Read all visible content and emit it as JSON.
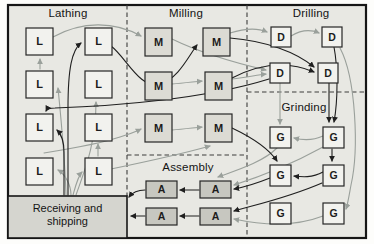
{
  "figure": {
    "title_hint": "process-layout-diagram",
    "background": "#e8e8e3",
    "border_color": "#161616",
    "divider_color": "#3c3c3c",
    "arrow_colors": {
      "primary": "#1f1f1f",
      "secondary": "#9aa09b"
    },
    "sections": [
      {
        "id": "lathing",
        "label": "Lathing",
        "cx": 68,
        "cy": 7
      },
      {
        "id": "milling",
        "label": "Milling",
        "cx": 186,
        "cy": 7
      },
      {
        "id": "drilling",
        "label": "Drilling",
        "cx": 311,
        "cy": 7
      },
      {
        "id": "grinding",
        "label": "Grinding",
        "cx": 304,
        "cy": 101
      },
      {
        "id": "assembly",
        "label": "Assembly",
        "cx": 188,
        "cy": 161
      }
    ],
    "receiving": {
      "label_line1": "Receiving and",
      "label_line2": "shipping",
      "x": 8,
      "y": 196,
      "w": 119,
      "h": 42,
      "fill": "#d5d5cf"
    },
    "dividers": [
      {
        "x1": 127,
        "y1": 5,
        "x2": 127,
        "y2": 196
      },
      {
        "x1": 247,
        "y1": 5,
        "x2": 247,
        "y2": 238
      },
      {
        "x1": 247,
        "y1": 92,
        "x2": 366,
        "y2": 92
      },
      {
        "x1": 127,
        "y1": 155,
        "x2": 247,
        "y2": 155
      }
    ],
    "nodes": [
      {
        "id": "L1",
        "letter": "L",
        "x": 26,
        "y": 28,
        "w": 27,
        "h": 27,
        "fill": "#f2f2ee"
      },
      {
        "id": "L2",
        "letter": "L",
        "x": 85,
        "y": 28,
        "w": 27,
        "h": 27,
        "fill": "#f2f2ee"
      },
      {
        "id": "L3",
        "letter": "L",
        "x": 26,
        "y": 71,
        "w": 27,
        "h": 27,
        "fill": "#f2f2ee"
      },
      {
        "id": "L4",
        "letter": "L",
        "x": 85,
        "y": 71,
        "w": 27,
        "h": 27,
        "fill": "#f2f2ee"
      },
      {
        "id": "L5",
        "letter": "L",
        "x": 26,
        "y": 114,
        "w": 27,
        "h": 27,
        "fill": "#f2f2ee"
      },
      {
        "id": "L6",
        "letter": "L",
        "x": 85,
        "y": 114,
        "w": 27,
        "h": 27,
        "fill": "#f2f2ee"
      },
      {
        "id": "L7",
        "letter": "L",
        "x": 26,
        "y": 158,
        "w": 27,
        "h": 27,
        "fill": "#f2f2ee"
      },
      {
        "id": "L8",
        "letter": "L",
        "x": 85,
        "y": 158,
        "w": 27,
        "h": 27,
        "fill": "#f2f2ee"
      },
      {
        "id": "M1",
        "letter": "M",
        "x": 145,
        "y": 28,
        "w": 27,
        "h": 28,
        "fill": "#dcdbd4"
      },
      {
        "id": "M2",
        "letter": "M",
        "x": 203,
        "y": 28,
        "w": 27,
        "h": 28,
        "fill": "#dcdbd4"
      },
      {
        "id": "M3",
        "letter": "M",
        "x": 145,
        "y": 72,
        "w": 27,
        "h": 28,
        "fill": "#dcdbd4"
      },
      {
        "id": "M4",
        "letter": "M",
        "x": 205,
        "y": 72,
        "w": 27,
        "h": 28,
        "fill": "#dcdbd4"
      },
      {
        "id": "M5",
        "letter": "M",
        "x": 145,
        "y": 114,
        "w": 27,
        "h": 28,
        "fill": "#dcdbd4"
      },
      {
        "id": "M6",
        "letter": "M",
        "x": 205,
        "y": 114,
        "w": 27,
        "h": 28,
        "fill": "#dcdbd4"
      },
      {
        "id": "D1",
        "letter": "D",
        "x": 271,
        "y": 27,
        "w": 20,
        "h": 20,
        "fill": "#f2f2ee"
      },
      {
        "id": "D2",
        "letter": "D",
        "x": 322,
        "y": 27,
        "w": 20,
        "h": 20,
        "fill": "#f2f2ee"
      },
      {
        "id": "D3",
        "letter": "D",
        "x": 270,
        "y": 63,
        "w": 20,
        "h": 20,
        "fill": "#f2f2ee"
      },
      {
        "id": "D4",
        "letter": "D",
        "x": 318,
        "y": 63,
        "w": 20,
        "h": 20,
        "fill": "#f2f2ee"
      },
      {
        "id": "G1",
        "letter": "G",
        "x": 270,
        "y": 127,
        "w": 21,
        "h": 21,
        "fill": "#f2f2ee"
      },
      {
        "id": "G2",
        "letter": "G",
        "x": 323,
        "y": 127,
        "w": 21,
        "h": 21,
        "fill": "#f2f2ee"
      },
      {
        "id": "G3",
        "letter": "G",
        "x": 270,
        "y": 165,
        "w": 21,
        "h": 21,
        "fill": "#f2f2ee"
      },
      {
        "id": "G4",
        "letter": "G",
        "x": 323,
        "y": 165,
        "w": 21,
        "h": 21,
        "fill": "#f2f2ee"
      },
      {
        "id": "G5",
        "letter": "G",
        "x": 270,
        "y": 203,
        "w": 21,
        "h": 21,
        "fill": "#f2f2ee"
      },
      {
        "id": "G6",
        "letter": "G",
        "x": 323,
        "y": 203,
        "w": 21,
        "h": 21,
        "fill": "#f2f2ee"
      },
      {
        "id": "A1",
        "letter": "A",
        "x": 146,
        "y": 181,
        "w": 31,
        "h": 17,
        "fill": "#c7c7c0"
      },
      {
        "id": "A2",
        "letter": "A",
        "x": 200,
        "y": 181,
        "w": 31,
        "h": 17,
        "fill": "#c7c7c0"
      },
      {
        "id": "A3",
        "letter": "A",
        "x": 146,
        "y": 208,
        "w": 31,
        "h": 17,
        "fill": "#c7c7c0"
      },
      {
        "id": "A4",
        "letter": "A",
        "x": 200,
        "y": 208,
        "w": 31,
        "h": 17,
        "fill": "#c7c7c0"
      }
    ],
    "edges": [
      {
        "from": "L3",
        "to": "L1",
        "color": "secondary",
        "path": "M40,69 L40,59"
      },
      {
        "from": "RS",
        "to": "L3",
        "color": "secondary",
        "path": "M66,195 C65,162 61,118 58,88"
      },
      {
        "from": "RS",
        "to": "L4",
        "color": "secondary",
        "path": "M76,195 C84,172 96,145 96,102"
      },
      {
        "from": "RS",
        "to": "L7",
        "color": "secondary",
        "path": "M71,195 C71,185 65,174 58,170"
      },
      {
        "from": "RS",
        "to": "L8",
        "color": "secondary",
        "path": "M73,195 C75,188 78,176 82,172"
      },
      {
        "from": "L8",
        "to": "L6",
        "color": "secondary",
        "path": "M98,156 L98,144"
      },
      {
        "from": "RS",
        "to": "M5",
        "color": "secondary",
        "path": "M44,153 C75,148 105,142 120,137 C130,134 137,131 141,129"
      },
      {
        "from": "L1",
        "to": "M1",
        "color": "secondary",
        "path": "M53,37 C82,21 114,21 141,36"
      },
      {
        "from": "M1",
        "to": "D3",
        "color": "secondary",
        "path": "M172,39 C205,55 240,64 266,70"
      },
      {
        "from": "M4",
        "to": "D3",
        "color": "secondary",
        "path": "M232,79 C248,77 257,75 266,74"
      },
      {
        "from": "M3",
        "to": "M4",
        "color": "secondary",
        "path": "M172,84 C183,83 192,82 202,81"
      },
      {
        "from": "M5",
        "to": "M6",
        "color": "secondary",
        "path": "M172,130 C183,129 192,128 202,127"
      },
      {
        "from": "L8",
        "to": "M6",
        "color": "secondary",
        "path": "M111,169 C145,162 185,153 210,146"
      },
      {
        "from": "D1",
        "to": "D2",
        "color": "secondary",
        "path": "M291,36 C301,30 310,29 319,33"
      },
      {
        "from": "D3",
        "to": "G1",
        "color": "secondary",
        "path": "M280,83 L280,124"
      },
      {
        "from": "G2",
        "to": "G1",
        "color": "secondary",
        "path": "M323,136 C312,141 302,140 294,138"
      },
      {
        "from": "G1",
        "to": "A2",
        "color": "secondary",
        "path": "M277,148 C262,163 234,171 218,177"
      },
      {
        "from": "G2",
        "to": "A2",
        "color": "secondary",
        "path": "M323,147 C292,164 256,178 234,185"
      },
      {
        "from": "G6",
        "to": "A4",
        "color": "secondary",
        "path": "M323,216 C292,228 257,224 234,219"
      },
      {
        "from": "D2",
        "to": "G6",
        "color": "secondary",
        "path": "M340,48 C356,78 359,150 351,185 C349,196 348,203 346,209"
      },
      {
        "from": "M2",
        "to": "D1",
        "color": "secondary",
        "path": "M230,33 C246,28 258,28 267,32"
      },
      {
        "from": "RS",
        "to": "L2",
        "color": "primary",
        "path": "M68,195 L68,108 C68,68 72,50 81,43"
      },
      {
        "from": "RS",
        "to": "L5",
        "color": "primary",
        "path": "M64,195 L64,152 C64,142 61,134 57,130"
      },
      {
        "from": "D3",
        "to": "L5",
        "color": "primary",
        "path": "M269,79 C205,99 115,106 55,108 C50,108 47,109 46,111"
      },
      {
        "from": "L2",
        "to": "M2",
        "color": "primary",
        "path": "M111,46 C126,57 140,90 160,84 C178,79 188,57 197,45"
      },
      {
        "from": "M2",
        "to": "D4",
        "color": "primary",
        "path": "M230,38 C266,41 296,52 314,67"
      },
      {
        "from": "M4",
        "to": "D4",
        "color": "primary",
        "path": "M232,78 C265,61 293,63 314,72"
      },
      {
        "from": "D4",
        "to": "G2",
        "color": "primary",
        "path": "M329,83 L329,122"
      },
      {
        "from": "D2",
        "to": "G2",
        "color": "primary",
        "path": "M334,47 C338,68 338,100 334,122"
      },
      {
        "from": "G2",
        "to": "G4",
        "color": "primary",
        "path": "M332,149 L332,161"
      },
      {
        "from": "G4",
        "to": "G3",
        "color": "primary",
        "path": "M323,172 C312,178 302,177 294,176"
      },
      {
        "from": "G3",
        "to": "A2",
        "color": "primary",
        "path": "M270,178 C255,184 245,187 234,189"
      },
      {
        "from": "G4",
        "to": "A4",
        "color": "primary",
        "path": "M322,183 C285,199 250,206 234,211"
      },
      {
        "from": "M6",
        "to": "G3",
        "color": "primary",
        "path": "M232,128 C253,138 269,149 277,161"
      },
      {
        "from": "A2",
        "to": "A1",
        "color": "primary",
        "path": "M199,190 L180,190"
      },
      {
        "from": "A4",
        "to": "A3",
        "color": "primary",
        "path": "M199,216 L180,216"
      },
      {
        "from": "A1",
        "to": "RS",
        "color": "primary",
        "path": "M145,190 C137,190 132,193 129,197"
      },
      {
        "from": "A3",
        "to": "RS",
        "color": "primary",
        "path": "M145,216 L131,216"
      }
    ]
  }
}
